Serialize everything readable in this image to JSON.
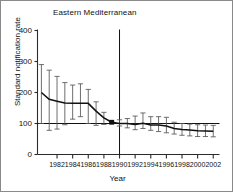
{
  "chart_data": {
    "type": "line",
    "title": "Eastern Mediterranean",
    "xlabel": "Year",
    "ylabel": "Standard notification rate",
    "xlim": [
      1979.5,
      2002.8
    ],
    "ylim": [
      0,
      400
    ],
    "yticks": [
      0,
      100,
      200,
      300,
      400
    ],
    "xticks": [
      1982,
      1984,
      1986,
      1988,
      1990,
      1992,
      1994,
      1996,
      1998,
      2000,
      2002
    ],
    "xtick_labels": [
      "1982",
      "1984",
      "1986",
      "1988",
      "1990",
      "1992",
      "1994",
      "1996",
      "1998",
      "2000",
      "2002"
    ],
    "ytick_labels": [
      "0",
      "100",
      "200",
      "300",
      "400"
    ],
    "grid": false,
    "legend": "none",
    "reference_line_y": 100,
    "reference_line_x": 1990,
    "marker_point": {
      "x": 1989,
      "y": 104
    },
    "x": [
      1980,
      1981,
      1982,
      1983,
      1984,
      1985,
      1986,
      1987,
      1988,
      1989,
      1990,
      1991,
      1992,
      1993,
      1994,
      1995,
      1996,
      1997,
      1998,
      1999,
      2000,
      2001,
      2002
    ],
    "values": [
      200,
      178,
      172,
      166,
      165,
      165,
      165,
      140,
      118,
      104,
      100,
      100,
      97,
      101,
      95,
      95,
      92,
      84,
      81,
      79,
      77,
      76,
      75
    ],
    "err_low": [
      100,
      78,
      82,
      96,
      114,
      122,
      100,
      94,
      97,
      104,
      92,
      86,
      80,
      84,
      78,
      74,
      70,
      66,
      62,
      60,
      58,
      58,
      57
    ],
    "err_high": [
      290,
      272,
      252,
      232,
      224,
      228,
      210,
      170,
      136,
      104,
      112,
      116,
      124,
      134,
      122,
      122,
      120,
      104,
      100,
      98,
      96,
      95,
      94
    ]
  },
  "axis_colors": {
    "axis": "#2b2b2b",
    "series": "#111111",
    "errorbar": "#555555",
    "reference": "#111111",
    "border": "#8a8a8a"
  }
}
